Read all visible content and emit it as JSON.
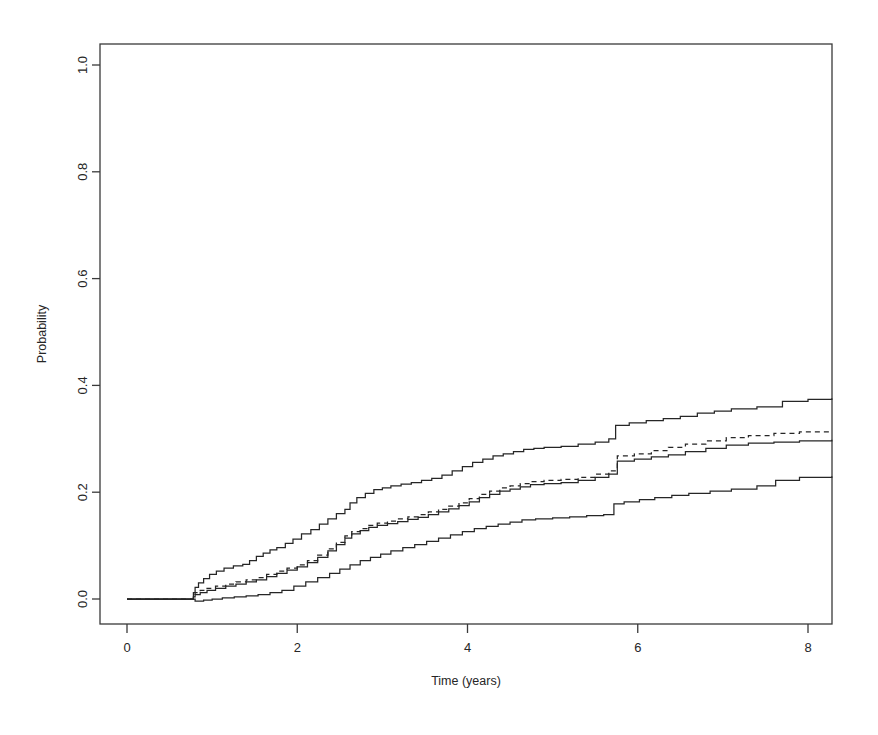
{
  "figure": {
    "background_color": "#ffffff",
    "line_color": "#262626",
    "box_color": "#3a3a3a"
  },
  "chart_data": {
    "type": "line",
    "subtype": "step",
    "title": "",
    "subtitle": "",
    "xlabel": "Time (years)",
    "ylabel": "Probability",
    "xlim": [
      -0.28,
      8.28
    ],
    "ylim": [
      -0.045,
      1.045
    ],
    "xticks": [
      0,
      2,
      4,
      6,
      8
    ],
    "xtick_labels": [
      "0",
      "2",
      "4",
      "6",
      "8"
    ],
    "yticks": [
      0.0,
      0.2,
      0.4,
      0.6,
      0.8,
      1.0
    ],
    "ytick_labels": [
      "0.0",
      "0.2",
      "0.4",
      "0.6",
      "0.8",
      "1.0"
    ],
    "grid": false,
    "legend": false,
    "legend_position": "none",
    "box_frame": true,
    "annotations": [],
    "series": [
      {
        "name": "Upper 95% confidence limit",
        "style": "solid",
        "color": "#262626",
        "final_value": 0.376,
        "x": [
          0.0,
          0.72,
          0.78,
          0.8,
          0.84,
          0.9,
          0.97,
          1.05,
          1.14,
          1.25,
          1.36,
          1.44,
          1.52,
          1.6,
          1.68,
          1.76,
          1.86,
          1.95,
          2.05,
          2.16,
          2.26,
          2.36,
          2.46,
          2.56,
          2.62,
          2.7,
          2.8,
          2.9,
          3.0,
          3.1,
          3.22,
          3.34,
          3.46,
          3.58,
          3.7,
          3.82,
          3.94,
          4.06,
          4.18,
          4.3,
          4.42,
          4.54,
          4.66,
          4.78,
          4.9,
          5.1,
          5.3,
          5.5,
          5.66,
          5.74,
          5.9,
          6.1,
          6.3,
          6.5,
          6.7,
          6.9,
          7.1,
          7.4,
          7.7,
          8.0,
          8.28
        ],
        "y": [
          0.0,
          0.0,
          0.012,
          0.022,
          0.03,
          0.038,
          0.046,
          0.052,
          0.058,
          0.062,
          0.065,
          0.072,
          0.08,
          0.086,
          0.092,
          0.096,
          0.104,
          0.112,
          0.122,
          0.13,
          0.14,
          0.15,
          0.16,
          0.168,
          0.18,
          0.19,
          0.198,
          0.205,
          0.208,
          0.212,
          0.215,
          0.218,
          0.222,
          0.226,
          0.232,
          0.24,
          0.248,
          0.256,
          0.262,
          0.268,
          0.272,
          0.276,
          0.28,
          0.282,
          0.284,
          0.286,
          0.29,
          0.294,
          0.3,
          0.325,
          0.33,
          0.334,
          0.338,
          0.342,
          0.348,
          0.352,
          0.356,
          0.36,
          0.37,
          0.374,
          0.376
        ]
      },
      {
        "name": "Dashed estimate curve",
        "style": "dashed",
        "color": "#262626",
        "final_value": 0.315,
        "x": [
          0.0,
          0.72,
          0.78,
          0.8,
          0.86,
          0.94,
          1.04,
          1.16,
          1.28,
          1.4,
          1.52,
          1.64,
          1.76,
          1.88,
          2.0,
          2.12,
          2.24,
          2.36,
          2.46,
          2.56,
          2.64,
          2.74,
          2.84,
          2.94,
          3.06,
          3.18,
          3.3,
          3.42,
          3.54,
          3.66,
          3.78,
          3.9,
          4.02,
          4.14,
          4.26,
          4.38,
          4.5,
          4.62,
          4.74,
          4.9,
          5.1,
          5.3,
          5.5,
          5.66,
          5.76,
          5.96,
          6.16,
          6.36,
          6.56,
          6.8,
          7.04,
          7.3,
          7.6,
          7.9,
          8.28
        ],
        "y": [
          0.0,
          0.0,
          0.006,
          0.012,
          0.016,
          0.02,
          0.024,
          0.028,
          0.032,
          0.036,
          0.04,
          0.046,
          0.052,
          0.058,
          0.064,
          0.072,
          0.082,
          0.094,
          0.106,
          0.118,
          0.126,
          0.132,
          0.138,
          0.142,
          0.146,
          0.15,
          0.154,
          0.158,
          0.163,
          0.168,
          0.174,
          0.18,
          0.188,
          0.196,
          0.202,
          0.208,
          0.212,
          0.216,
          0.22,
          0.222,
          0.224,
          0.228,
          0.234,
          0.24,
          0.268,
          0.272,
          0.278,
          0.284,
          0.29,
          0.296,
          0.302,
          0.306,
          0.31,
          0.313,
          0.315
        ]
      },
      {
        "name": "Solid estimate curve",
        "style": "solid",
        "color": "#262626",
        "final_value": 0.298,
        "x": [
          0.0,
          0.72,
          0.78,
          0.8,
          0.86,
          0.94,
          1.04,
          1.16,
          1.28,
          1.4,
          1.52,
          1.64,
          1.76,
          1.88,
          2.0,
          2.12,
          2.24,
          2.36,
          2.46,
          2.56,
          2.64,
          2.74,
          2.84,
          2.94,
          3.06,
          3.18,
          3.3,
          3.42,
          3.54,
          3.66,
          3.78,
          3.9,
          4.02,
          4.14,
          4.26,
          4.38,
          4.5,
          4.62,
          4.74,
          4.9,
          5.1,
          5.3,
          5.5,
          5.66,
          5.76,
          5.96,
          6.16,
          6.36,
          6.56,
          6.8,
          7.04,
          7.3,
          7.6,
          7.9,
          8.28
        ],
        "y": [
          0.0,
          0.0,
          0.004,
          0.008,
          0.012,
          0.016,
          0.02,
          0.024,
          0.028,
          0.032,
          0.036,
          0.042,
          0.048,
          0.054,
          0.06,
          0.068,
          0.078,
          0.09,
          0.102,
          0.114,
          0.122,
          0.128,
          0.134,
          0.138,
          0.141,
          0.145,
          0.149,
          0.153,
          0.158,
          0.163,
          0.169,
          0.175,
          0.182,
          0.19,
          0.196,
          0.202,
          0.206,
          0.21,
          0.214,
          0.216,
          0.218,
          0.222,
          0.228,
          0.234,
          0.258,
          0.262,
          0.266,
          0.27,
          0.276,
          0.282,
          0.288,
          0.292,
          0.294,
          0.296,
          0.298
        ]
      },
      {
        "name": "Lower 95% confidence limit",
        "style": "solid",
        "color": "#262626",
        "final_value": 0.23,
        "x": [
          0.0,
          0.72,
          0.8,
          0.9,
          1.0,
          1.12,
          1.26,
          1.4,
          1.54,
          1.68,
          1.82,
          1.96,
          2.1,
          2.24,
          2.38,
          2.5,
          2.62,
          2.74,
          2.86,
          2.98,
          3.1,
          3.24,
          3.38,
          3.52,
          3.66,
          3.8,
          3.94,
          4.08,
          4.22,
          4.36,
          4.5,
          4.64,
          4.8,
          5.0,
          5.2,
          5.4,
          5.6,
          5.72,
          5.84,
          6.02,
          6.2,
          6.4,
          6.6,
          6.85,
          7.1,
          7.4,
          7.62,
          7.9,
          8.28
        ],
        "y": [
          0.0,
          0.0,
          -0.004,
          -0.002,
          0.0,
          0.002,
          0.004,
          0.006,
          0.008,
          0.012,
          0.016,
          0.024,
          0.032,
          0.04,
          0.048,
          0.056,
          0.064,
          0.072,
          0.078,
          0.084,
          0.09,
          0.096,
          0.102,
          0.108,
          0.114,
          0.12,
          0.126,
          0.132,
          0.136,
          0.14,
          0.144,
          0.148,
          0.15,
          0.152,
          0.154,
          0.156,
          0.158,
          0.178,
          0.182,
          0.186,
          0.19,
          0.194,
          0.198,
          0.202,
          0.206,
          0.212,
          0.222,
          0.228,
          0.23
        ]
      }
    ]
  }
}
